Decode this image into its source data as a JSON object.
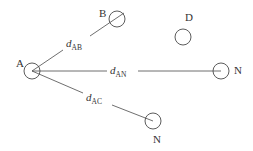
{
  "diagram": {
    "nodes": [
      {
        "id": "A",
        "label": "A",
        "cx": 32,
        "cy": 71,
        "r": 8,
        "label_x": 16,
        "label_y": 67
      },
      {
        "id": "B",
        "label": "B",
        "cx": 117,
        "cy": 19,
        "r": 8,
        "label_x": 99,
        "label_y": 17
      },
      {
        "id": "D",
        "label": "D",
        "cx": 183,
        "cy": 37,
        "r": 8,
        "label_x": 185,
        "label_y": 21
      },
      {
        "id": "N1",
        "label": "N",
        "cx": 221,
        "cy": 71,
        "r": 8,
        "label_x": 234,
        "label_y": 74
      },
      {
        "id": "N2",
        "label": "N",
        "cx": 153,
        "cy": 121,
        "r": 8,
        "label_x": 153,
        "label_y": 143
      }
    ],
    "edges": [
      {
        "from": "A",
        "to": "B",
        "label_main": "d",
        "label_sub": "AB",
        "label_x": 66,
        "label_y": 47,
        "segments": [
          [
            32,
            71,
            63,
            50
          ],
          [
            90,
            36,
            124,
            13
          ]
        ]
      },
      {
        "from": "A",
        "to": "N1",
        "label_main": "d",
        "label_sub": "AN",
        "label_x": 110,
        "label_y": 74,
        "segments": [
          [
            32,
            71,
            107,
            71
          ],
          [
            138,
            71,
            221,
            71
          ]
        ]
      },
      {
        "from": "A",
        "to": "N2",
        "label_main": "d",
        "label_sub": "AC",
        "label_x": 86,
        "label_y": 101,
        "segments": [
          [
            32,
            71,
            83,
            93
          ],
          [
            112,
            105,
            153,
            121
          ]
        ]
      }
    ]
  }
}
